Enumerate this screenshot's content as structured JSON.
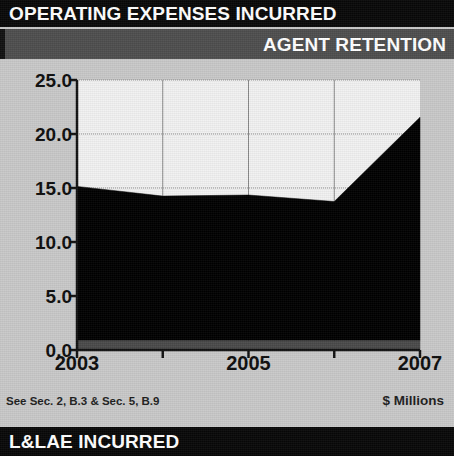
{
  "header": {
    "title": "OPERATING EXPENSES INCURRED",
    "subtitle": "AGENT RETENTION"
  },
  "footer": {
    "title": "L&LAE INCURRED"
  },
  "footnotes": {
    "left": "See Sec. 2, B.3 & Sec. 5, B.9",
    "right": "$ Millions"
  },
  "colors": {
    "page_background": "#c9c9c9",
    "title_bar": "#080808",
    "subtitle_bar": "#4e4e4e",
    "plot_background": "#f2f2f2",
    "series_main": "#000000",
    "series_base": "#4a4a4a",
    "axis": "#111111",
    "gridline": "#8a8a8a",
    "label_text": "#0d0d0d",
    "bar_text": "#ffffff"
  },
  "chart_data": {
    "type": "area",
    "stacked": true,
    "title": "AGENT RETENTION",
    "xlabel": "",
    "ylabel": "$ Millions",
    "ylim": [
      0.0,
      25.0
    ],
    "yticks": [
      "0.0",
      "5.0",
      "10.0",
      "15.0",
      "20.0",
      "25.0"
    ],
    "ytick_values": [
      0.0,
      5.0,
      10.0,
      15.0,
      20.0,
      25.0
    ],
    "x": [
      2003,
      2004,
      2005,
      2006,
      2007
    ],
    "xticks": [
      "2003",
      "2005",
      "2007"
    ],
    "xtick_values": [
      2003,
      2005,
      2007
    ],
    "grid": true,
    "legend": "none",
    "series": [
      {
        "name": "base-band",
        "color": "#4a4a4a",
        "values": [
          0.85,
          0.85,
          0.85,
          0.85,
          0.85
        ]
      },
      {
        "name": "agent-retention",
        "color": "#000000",
        "values": [
          14.3,
          13.4,
          13.5,
          12.9,
          20.7
        ]
      }
    ]
  }
}
